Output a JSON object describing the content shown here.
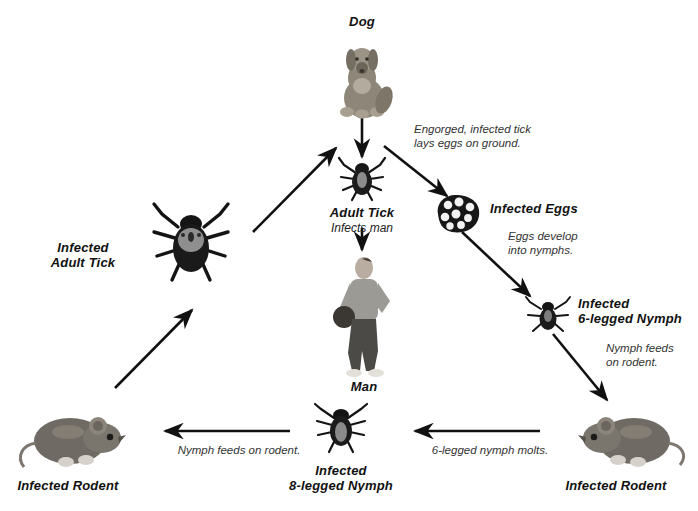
{
  "diagram": {
    "background": "#ffffff",
    "ink": "#111111"
  },
  "nodes": [
    {
      "id": "dog",
      "label": "Dog",
      "sublabel": ""
    },
    {
      "id": "adult-tick",
      "label": "Adult Tick",
      "sublabel": "Infects man"
    },
    {
      "id": "infected-eggs",
      "label": "Infected Eggs",
      "sublabel": ""
    },
    {
      "id": "nymph6",
      "label": "Infected\n6-legged Nymph",
      "sublabel": ""
    },
    {
      "id": "rodent-right",
      "label": "Infected Rodent",
      "sublabel": ""
    },
    {
      "id": "nymph8",
      "label": "Infected\n8-legged Nymph",
      "sublabel": ""
    },
    {
      "id": "rodent-left",
      "label": "Infected Rodent",
      "sublabel": ""
    },
    {
      "id": "infected-adult",
      "label": "Infected\nAdult Tick",
      "sublabel": ""
    },
    {
      "id": "man",
      "label": "Man",
      "sublabel": ""
    }
  ],
  "notes": [
    {
      "id": "note-eggs",
      "text": "Engorged, infected tick\nlays eggs on ground."
    },
    {
      "id": "note-develop",
      "text": "Eggs develop\ninto nymphs."
    },
    {
      "id": "note-nymph-feeds",
      "text": "Nymph feeds\non rodent."
    },
    {
      "id": "note-molts",
      "text": "6-legged nymph molts."
    },
    {
      "id": "note-feeds-rodent",
      "text": "Nymph feeds on rodent."
    }
  ]
}
